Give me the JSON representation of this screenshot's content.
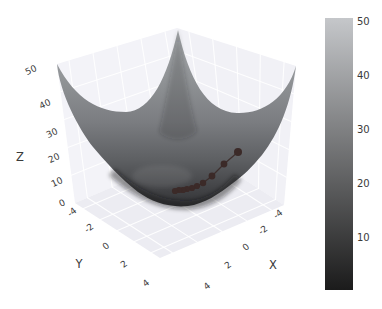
{
  "figure": {
    "background": "#ffffff"
  },
  "axes": {
    "x": {
      "label": "X",
      "label_pos": [
        273,
        265
      ],
      "tick_labels": [
        "4",
        "2",
        "0",
        "-2",
        "-4"
      ],
      "tick_positions": [
        [
          207,
          286
        ],
        [
          228,
          265
        ],
        [
          246,
          247
        ],
        [
          263,
          230
        ],
        [
          278,
          214
        ]
      ]
    },
    "y": {
      "label": "Y",
      "label_pos": [
        79,
        264
      ],
      "tick_labels": [
        "-4",
        "-2",
        "0",
        "2",
        "4"
      ],
      "tick_positions": [
        [
          72,
          212
        ],
        [
          89,
          228
        ],
        [
          106,
          246
        ],
        [
          124,
          264
        ],
        [
          146,
          283
        ]
      ]
    },
    "z": {
      "label": "Z",
      "label_pos": [
        20,
        157
      ],
      "tick_labels": [
        "0",
        "10",
        "20",
        "30",
        "40",
        "50"
      ],
      "tick_positions": [
        [
          62,
          203
        ],
        [
          57,
          182
        ],
        [
          54,
          158
        ],
        [
          52,
          133
        ],
        [
          45,
          104
        ],
        [
          31,
          70
        ]
      ]
    }
  },
  "colorbar": {
    "x": 325,
    "y": 18,
    "width": 28,
    "height": 272,
    "value_min": 0,
    "value_max": 50,
    "tick_labels": [
      "10",
      "20",
      "30",
      "40",
      "50"
    ],
    "tick_positions": [
      [
        357,
        237
      ],
      [
        357,
        183
      ],
      [
        357,
        129
      ],
      [
        357,
        75
      ],
      [
        357,
        21
      ]
    ],
    "color_low": "#1b1b1b",
    "color_high": "#c5c7ca"
  },
  "chart_data": {
    "type": "surface",
    "title": "",
    "surface": {
      "function": "z = x^2 + y^2",
      "x_range": [
        -5,
        5
      ],
      "y_range": [
        -5,
        5
      ],
      "z_range": [
        0,
        50
      ],
      "colormap": "gray (dark = low z, light = high z)",
      "x_ticks": [
        -4,
        -2,
        0,
        2,
        4
      ],
      "y_ticks": [
        -4,
        -2,
        0,
        2,
        4
      ],
      "z_ticks": [
        0,
        10,
        20,
        30,
        40,
        50
      ]
    },
    "descent_path": {
      "description": "gradient-descent iterates on the bowl, converging to the minimum (3D values estimated from the figure)",
      "marker_color": "#3b2a28",
      "points_xyz": [
        [
          -1.5,
          4.0,
          18.3
        ],
        [
          -1.2,
          3.2,
          11.7
        ],
        [
          -0.96,
          2.56,
          7.5
        ],
        [
          -0.77,
          2.05,
          4.8
        ],
        [
          -0.61,
          1.64,
          3.1
        ],
        [
          -0.49,
          1.31,
          2.0
        ],
        [
          -0.39,
          1.05,
          1.3
        ],
        [
          -0.31,
          0.84,
          0.8
        ],
        [
          -0.25,
          0.67,
          0.5
        ],
        [
          -0.2,
          0.54,
          0.3
        ]
      ],
      "points_screen": [
        [
          238,
          152,
          4.0
        ],
        [
          224,
          164,
          3.4
        ],
        [
          212,
          176,
          3.4
        ],
        [
          203,
          183,
          3.2
        ],
        [
          197,
          186,
          3.1
        ],
        [
          192,
          188,
          3.1
        ],
        [
          187,
          189,
          3.1
        ],
        [
          183,
          190,
          3.1
        ],
        [
          179,
          190,
          3.1
        ],
        [
          175,
          191,
          3.1
        ]
      ]
    },
    "legend": null,
    "grid": true
  }
}
